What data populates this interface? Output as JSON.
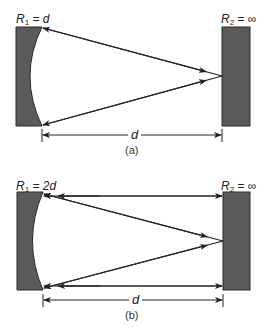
{
  "figure": {
    "panels": [
      {
        "id": "a",
        "caption": "(a)",
        "mirror_left": {
          "label_symbol": "R",
          "label_sub": "1",
          "label_value": "= d",
          "type": "concave",
          "radius": "d"
        },
        "mirror_right": {
          "label_symbol": "R",
          "label_sub": "2",
          "label_value": "= ∞",
          "type": "flat",
          "radius": "∞"
        },
        "distance_label": "d",
        "beams": [
          "diagonal-top",
          "diagonal-bottom"
        ]
      },
      {
        "id": "b",
        "caption": "(b)",
        "mirror_left": {
          "label_symbol": "R",
          "label_sub": "1",
          "label_value": "= 2d",
          "type": "concave",
          "radius": "2d"
        },
        "mirror_right": {
          "label_symbol": "R",
          "label_sub": "2",
          "label_value": "= ∞",
          "type": "flat",
          "radius": "∞"
        },
        "distance_label": "d",
        "beams": [
          "horizontal-top",
          "diagonal-top",
          "diagonal-bottom",
          "horizontal-bottom"
        ]
      }
    ],
    "colors": {
      "mirror_fill": "#5a5a5a",
      "mirror_stroke": "#2a2a2a",
      "line": "#222222",
      "background": "#ffffff"
    }
  }
}
